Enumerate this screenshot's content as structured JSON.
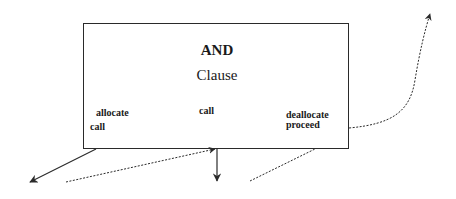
{
  "diagram": {
    "box": {
      "title": "AND",
      "subtitle": "Clause",
      "labels": {
        "allocate": "allocate",
        "call_left": "call",
        "call_middle": "call",
        "deallocate": "deallocate",
        "proceed": "proceed"
      }
    },
    "arrows": [
      {
        "name": "allocate-call-out",
        "style": "solid",
        "direction": "down-left"
      },
      {
        "name": "call-return-in",
        "style": "dotted",
        "direction": "right-up"
      },
      {
        "name": "call-out-down",
        "style": "solid",
        "direction": "down"
      },
      {
        "name": "proceed-in",
        "style": "dotted",
        "direction": "up-right"
      },
      {
        "name": "deallocate-proceed-out",
        "style": "dotted",
        "direction": "up"
      }
    ],
    "colors": {
      "line": "#2a2a2a",
      "background": "#ffffff"
    }
  }
}
